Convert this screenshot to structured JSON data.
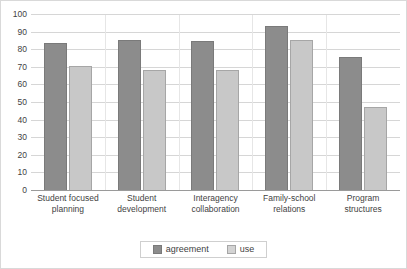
{
  "chart_data": {
    "type": "bar",
    "title": "",
    "xlabel": "",
    "ylabel": "",
    "ylim": [
      0,
      100
    ],
    "ytick_step": 10,
    "yticks": [
      100,
      90,
      80,
      70,
      60,
      50,
      40,
      30,
      20,
      10,
      0
    ],
    "grid": true,
    "legend_position": "bottom-center",
    "categories": [
      "Student focused planning",
      "Student development",
      "Interagency collaboration",
      "Family-school relations",
      "Program structures"
    ],
    "series": [
      {
        "name": "agreement",
        "color": "#8c8c8c",
        "values": [
          84,
          86,
          85,
          94,
          76
        ]
      },
      {
        "name": "use",
        "color": "#c8c8c8",
        "values": [
          71,
          69,
          69,
          86,
          48
        ]
      }
    ]
  }
}
